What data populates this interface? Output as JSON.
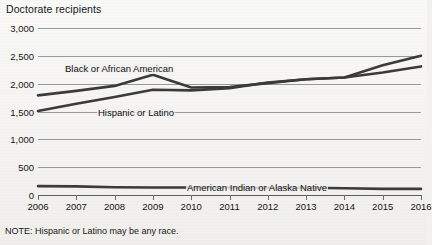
{
  "chart_data": {
    "type": "line",
    "title": "Doctorate recipients",
    "xlabel": "",
    "ylabel": "Doctorate recipients",
    "x": [
      2006,
      2007,
      2008,
      2009,
      2010,
      2011,
      2012,
      2013,
      2014,
      2015,
      2016
    ],
    "categories": [
      "2006",
      "2007",
      "2008",
      "2009",
      "2010",
      "2011",
      "2012",
      "2013",
      "2014",
      "2015",
      "2016"
    ],
    "ylim": [
      0,
      3000
    ],
    "yticks": [
      0,
      500,
      1000,
      1500,
      2000,
      2500,
      3000
    ],
    "ytick_labels": [
      "0",
      "500",
      "1,000",
      "1,500",
      "2,000",
      "2,500",
      "3,000"
    ],
    "grid": true,
    "legend_position": "inline-annotations",
    "series": [
      {
        "name": "Black or African American",
        "color": "#3b3b3b",
        "values": [
          1790,
          1870,
          1960,
          2160,
          1930,
          1940,
          2010,
          2080,
          2110,
          2200,
          2310
        ]
      },
      {
        "name": "Hispanic or Latino",
        "color": "#3b3b3b",
        "values": [
          1510,
          1640,
          1760,
          1890,
          1880,
          1920,
          2020,
          2080,
          2110,
          2330,
          2500
        ]
      },
      {
        "name": "American Indian or Alaska Native",
        "color": "#3b3b3b",
        "values": [
          160,
          155,
          140,
          135,
          135,
          135,
          130,
          130,
          120,
          110,
          110
        ]
      }
    ],
    "annotations": [
      {
        "text": "Black or African American",
        "x_px": 64,
        "y_px": 63
      },
      {
        "text": "Hispanic or Latino",
        "x_px": 97,
        "y_px": 107
      },
      {
        "text": "American Indian or Alaska Native",
        "x_px": 186,
        "y_px": 182
      }
    ],
    "note": "NOTE: Hispanic or Latino may be any race."
  }
}
